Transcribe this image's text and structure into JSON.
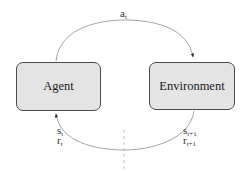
{
  "nodes": {
    "agent": {
      "label": "Agent"
    },
    "environment": {
      "label": "Environment"
    }
  },
  "edges": {
    "action": {
      "symbol": "a",
      "subscript": "t",
      "from": "Agent",
      "to": "Environment"
    },
    "feedback": {
      "from": "Environment",
      "to": "Agent",
      "current_state": {
        "symbol": "s",
        "subscript": "t"
      },
      "current_reward": {
        "symbol": "r",
        "subscript": "t"
      },
      "next_state": {
        "symbol": "s",
        "subscript": "t+1"
      },
      "next_reward": {
        "symbol": "r",
        "subscript": "t+1"
      }
    }
  },
  "colors": {
    "box_fill": "#e4e4e4",
    "box_border": "#4a4a4a",
    "edge": "#9a9a9a",
    "divider": "#b0b0b0"
  }
}
